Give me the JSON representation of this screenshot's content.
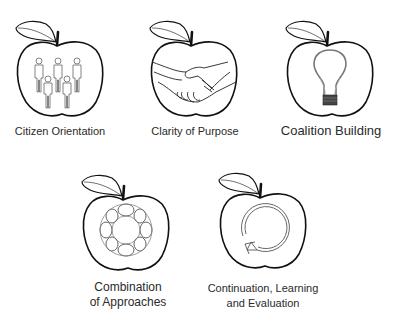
{
  "diagram": {
    "items": [
      {
        "id": "citizen-orientation",
        "label_lines": [
          "Citizen Orientation"
        ],
        "icon": "people-group-icon"
      },
      {
        "id": "clarity-of-purpose",
        "label_lines": [
          "Clarity of Purpose"
        ],
        "icon": "handshake-icon"
      },
      {
        "id": "coalition-building",
        "label_lines": [
          "Coalition Building"
        ],
        "icon": "lightbulb-icon"
      },
      {
        "id": "combination-of-approaches",
        "label_lines": [
          "Combination",
          "of Approaches"
        ],
        "icon": "ring-of-links-icon"
      },
      {
        "id": "continuation-learning-evaluation",
        "label_lines": [
          "Continuation, Learning",
          "and Evaluation"
        ],
        "icon": "cycle-arrow-icon"
      }
    ]
  },
  "colors": {
    "outline": "#111111",
    "icon_stroke": "#555555",
    "text": "#2a2a2a",
    "bulb_base": "#444444"
  }
}
